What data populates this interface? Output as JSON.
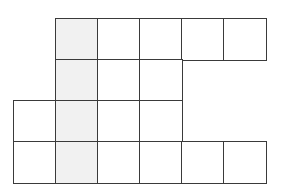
{
  "diagram": {
    "type": "grid-net",
    "cell_width": 42,
    "cell_height": 41,
    "origin_x": 13,
    "origin_y": 18,
    "colors": {
      "line": "#3a3a3a",
      "fill": "#ffffff",
      "shaded": "#f1f1f1"
    },
    "rows": [
      {
        "row": 0,
        "cells": [
          {
            "col": 1,
            "shaded": true
          },
          {
            "col": 2,
            "shaded": false
          },
          {
            "col": 3,
            "shaded": false
          },
          {
            "col": 4,
            "shaded": false
          },
          {
            "col": 5,
            "shaded": false
          }
        ]
      },
      {
        "row": 1,
        "cells": [
          {
            "col": 1,
            "shaded": true
          },
          {
            "col": 2,
            "shaded": false
          },
          {
            "col": 3,
            "shaded": false
          }
        ]
      },
      {
        "row": 2,
        "cells": [
          {
            "col": 0,
            "shaded": false
          },
          {
            "col": 1,
            "shaded": true
          },
          {
            "col": 2,
            "shaded": false
          },
          {
            "col": 3,
            "shaded": false
          }
        ]
      },
      {
        "row": 3,
        "cells": [
          {
            "col": 0,
            "shaded": false
          },
          {
            "col": 1,
            "shaded": true
          },
          {
            "col": 2,
            "shaded": false
          },
          {
            "col": 3,
            "shaded": false
          },
          {
            "col": 4,
            "shaded": false
          },
          {
            "col": 5,
            "shaded": false
          }
        ]
      }
    ]
  }
}
